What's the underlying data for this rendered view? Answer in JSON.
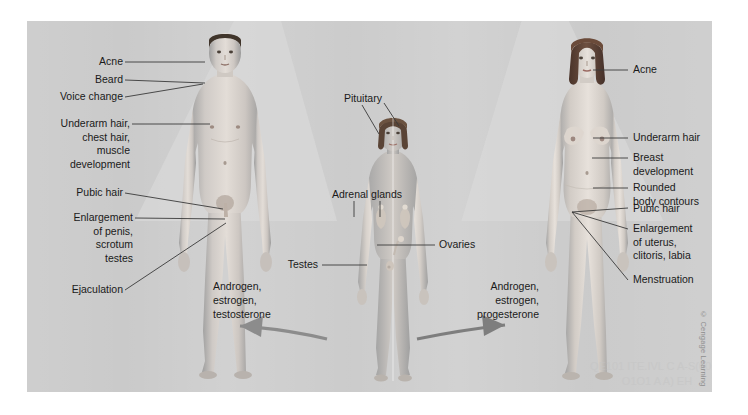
{
  "figure": {
    "panel_bg": "#c9c9c9",
    "cone_color": "#d8d8d8",
    "credit": "© Cengage Learning"
  },
  "male": {
    "labels": [
      {
        "text": "Acne"
      },
      {
        "text": "Beard"
      },
      {
        "text": "Voice change"
      },
      {
        "text": "Underarm hair,\nchest hair,\nmuscle\ndevelopment"
      },
      {
        "text": "Pubic hair"
      },
      {
        "text": "Enlargement\nof penis,\nscrotum\ntestes"
      },
      {
        "text": "Ejaculation"
      }
    ],
    "hormones": "Androgen,\nestrogen,\ntestosterone"
  },
  "female": {
    "labels": [
      {
        "text": "Acne"
      },
      {
        "text": "Underarm hair"
      },
      {
        "text": "Breast\ndevelopment"
      },
      {
        "text": "Rounded\nbody contours"
      },
      {
        "text": "Pubic hair"
      },
      {
        "text": "Enlargement\nof uterus,\nclitoris, labia"
      },
      {
        "text": "Menstruation"
      }
    ],
    "hormones": "Androgen,\nestrogen,\nprogesterone"
  },
  "center": {
    "labels": [
      {
        "text": "Pituitary"
      },
      {
        "text": "Adrenal glands"
      },
      {
        "text": "Ovaries"
      },
      {
        "text": "Testes"
      }
    ]
  },
  "watermark": {
    "text": "QE101  ITE.IVL\nC   A-S(00 (0 O1O1 A  A)  EH"
  }
}
